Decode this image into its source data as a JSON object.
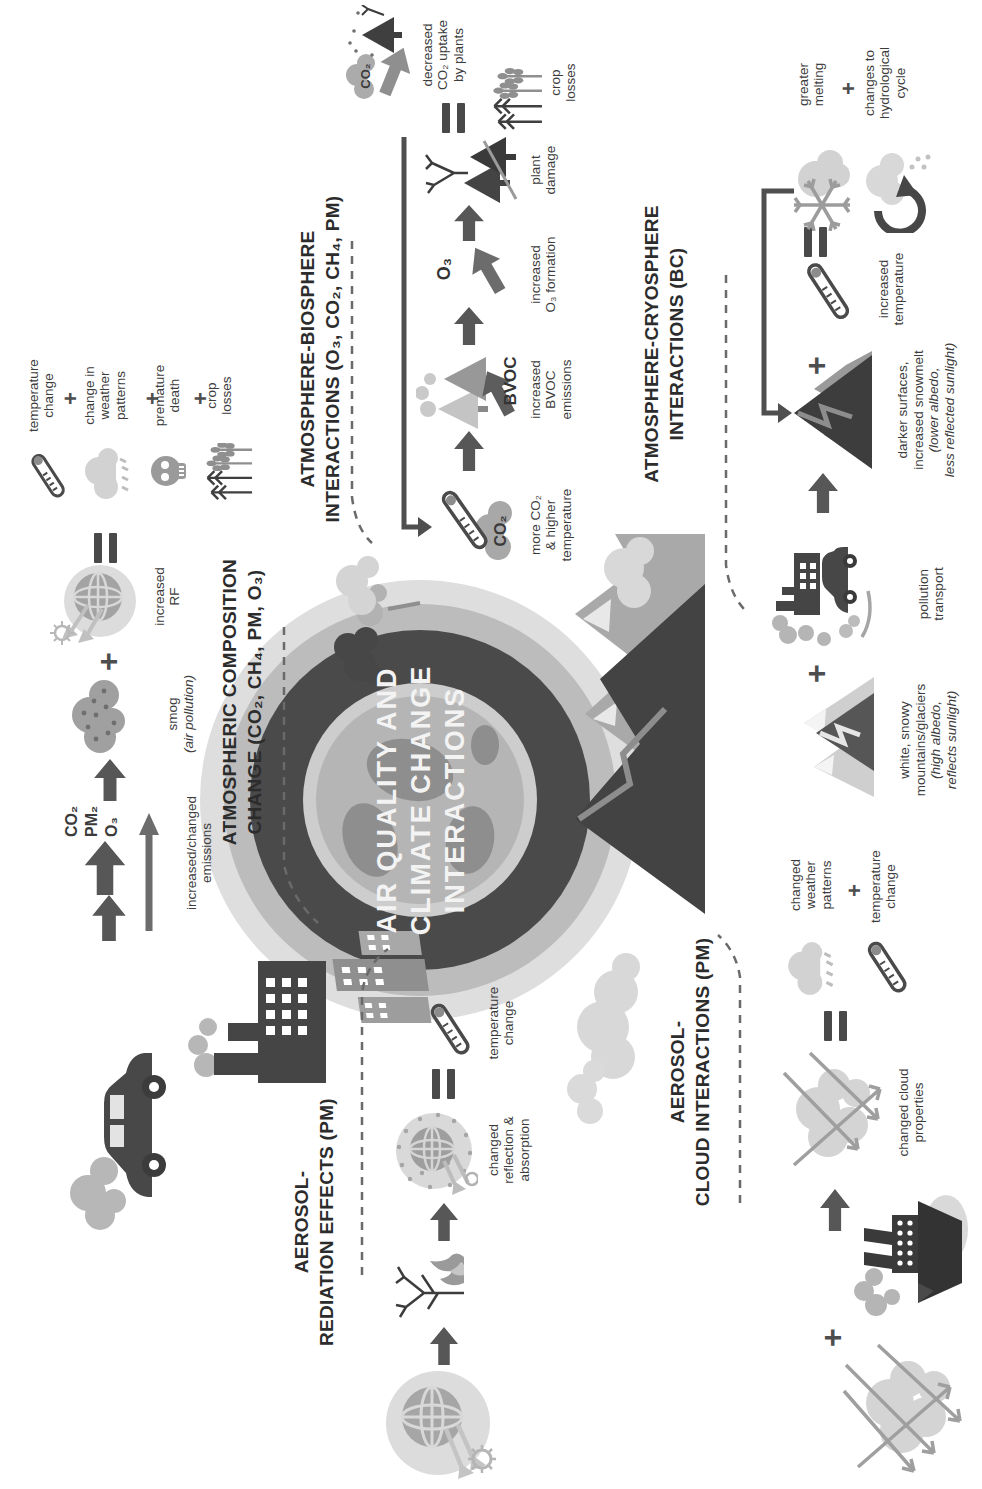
{
  "globe": {
    "line1": "AIR QUALITY AND",
    "line2": "CLIMATE CHANGE",
    "line3": "INTERACTIONS"
  },
  "symbols": {
    "plus": "+"
  },
  "composition": {
    "title": "ATMOSPHERIC COMPOSITION\nCHANGE (CO₂, CH₄, PM, O₃)",
    "pollutants": "CO₂\nPM₂\nO₃",
    "emissions_label": "increased/changed\nemissions",
    "smog_label": "smog",
    "smog_note": "(air pollution)",
    "rf_label": "increased\nRF",
    "outcome_temperature": "temperature\nchange",
    "outcome_weather": "change in\nweather\npatterns",
    "outcome_death": "premature\ndeath",
    "outcome_crop": "crop\nlosses"
  },
  "biosphere": {
    "title": "ATMOSPHERE-BIOSPHERE\nINTERACTIONS (O₃, CO₂, CH₄, PM)",
    "co2_cloud": "CO₂",
    "more_co2_label": "more CO₂\n& higher\ntemperature",
    "bvoc": "BVOC",
    "bvoc_label": "increased\nBVOC\nemissions",
    "o3": "O₃",
    "o3_label": "increased\nO₃ formation",
    "plant_label": "plant\ndamage",
    "uptake_cloud": "CO₂",
    "uptake_label": "decreased\nCO₂ uptake\nby plants",
    "crop_label": "crop\nlosses"
  },
  "cryosphere": {
    "title": "ATMOSPHERE-CRYOSPHERE\nINTERACTIONS (BC)",
    "white_label": "white, snowy\nmountains/glaciers",
    "white_note": "(high albedo,\nreflects sunlight)",
    "pollution_label": "pollution\ntransport",
    "dark_label": "darker surfaces,\nincreased snowmelt",
    "dark_note": "(lower albedo,\nless reflected sunlight)",
    "temp_label": "increased\ntemperature",
    "melt_label": "greater\nmelting",
    "hydro_label": "changes to\nhydrological\ncycle"
  },
  "radiation": {
    "title": "AEROSOL-\nREDIATION EFFECTS (PM)",
    "reflection_label": "changed\nreflection &\nabsorption",
    "temp_label": "temperature\nchange"
  },
  "cloud": {
    "title": "AEROSOL-\nCLOUD INTERACTIONS (PM)",
    "cloud_label": "changed cloud\nproperties",
    "weather_label": "changed\nweather\npatterns",
    "temp_label": "temperature\nchange"
  }
}
